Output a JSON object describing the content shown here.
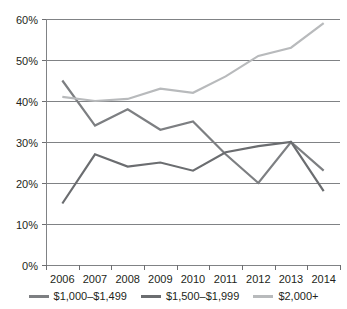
{
  "chart_data": {
    "type": "line",
    "title": "",
    "subtitle": "",
    "xlabel": "",
    "ylabel": "",
    "categories": [
      "2006",
      "2007",
      "2008",
      "2009",
      "2010",
      "2011",
      "2012",
      "2013",
      "2014"
    ],
    "series": [
      {
        "name": "$1,000–$1,499",
        "color": "#7d7f82",
        "values": [
          45,
          34,
          38,
          33,
          35,
          27,
          20,
          30,
          23
        ]
      },
      {
        "name": "$1,500–$1,999",
        "color": "#6b6d70",
        "values": [
          15,
          27,
          24,
          25,
          23,
          27.5,
          29,
          30,
          18
        ]
      },
      {
        "name": "$2,000+",
        "color": "#b8babc",
        "values": [
          41,
          40,
          40.5,
          43,
          42,
          46,
          51,
          53,
          59
        ]
      }
    ],
    "ylim": [
      0,
      60
    ],
    "ytick_values": [
      0,
      10,
      20,
      30,
      40,
      50,
      60
    ],
    "ytick_labels": [
      "0%",
      "10%",
      "20%",
      "30%",
      "40%",
      "50%",
      "60%"
    ],
    "xtick_labels": [
      "2006",
      "2007",
      "2008",
      "2009",
      "2010",
      "2011",
      "2012",
      "2013",
      "2014"
    ],
    "grid": true,
    "grid_axis": "y",
    "legend_position": "bottom",
    "annotations": []
  },
  "legend": {
    "items": [
      {
        "label": "$1,000–$1,499",
        "color": "#7d7f82"
      },
      {
        "label": "$1,500–$1,999",
        "color": "#6b6d70"
      },
      {
        "label": "$2,000+",
        "color": "#b8babc"
      }
    ]
  },
  "colors": {
    "background": "#ffffff",
    "axis": "#808285",
    "grid": "#808285",
    "text": "#231f20"
  }
}
